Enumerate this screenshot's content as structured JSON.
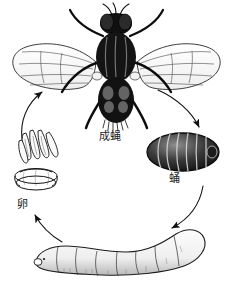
{
  "figure": {
    "background_color": "#ffffff",
    "ink_color": "#111111"
  },
  "stages": [
    {
      "id": "adult",
      "label": "成蝇",
      "icon": "housefly-dorsal-icon",
      "position": "top-center"
    },
    {
      "id": "pupa",
      "label": "蛹",
      "icon": "pupa-barrel-icon",
      "position": "right"
    },
    {
      "id": "larva",
      "label": "",
      "icon": "larva-maggot-icon",
      "position": "bottom"
    },
    {
      "id": "egg",
      "label": "卵",
      "icon": "egg-cluster-icon",
      "position": "left"
    }
  ],
  "arrows": [
    {
      "id": "adult-to-pupa",
      "from": "adult",
      "to": "pupa",
      "direction": "down-right"
    },
    {
      "id": "pupa-to-larva",
      "from": "pupa",
      "to": "larva",
      "direction": "down-left"
    },
    {
      "id": "larva-to-egg",
      "from": "larva",
      "to": "egg",
      "direction": "up-left"
    },
    {
      "id": "egg-to-adult",
      "from": "egg",
      "to": "adult",
      "direction": "up-right"
    }
  ]
}
